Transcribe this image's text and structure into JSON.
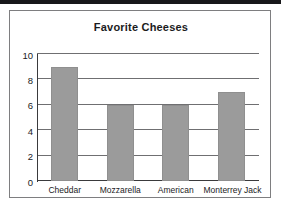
{
  "chart_data": {
    "type": "bar",
    "title": "Favorite Cheeses",
    "xlabel": "",
    "ylabel": "",
    "categories": [
      "Cheddar",
      "Mozzarella",
      "American",
      "Monterrey Jack"
    ],
    "values": [
      9,
      6,
      6,
      7
    ],
    "ylim": [
      0,
      10
    ],
    "ytick_labels": [
      "0",
      "2",
      "4",
      "6",
      "8",
      "10"
    ],
    "ytick_values": [
      0,
      2,
      4,
      6,
      8,
      10
    ],
    "grid": true,
    "legend": false,
    "bar_color": "#9b9b9b",
    "axis_color": "#3a3a3c",
    "grid_color": "#6f6f71",
    "text_color": "#1b1b1d",
    "background_color": "#ffffff"
  }
}
